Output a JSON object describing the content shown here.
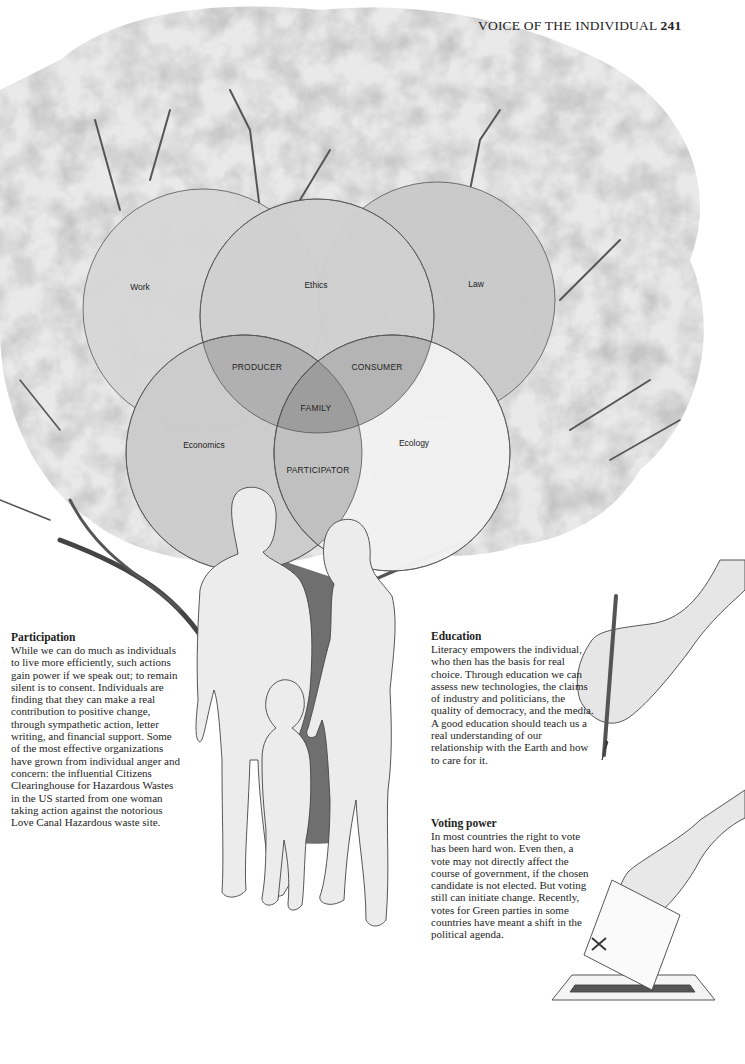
{
  "header": {
    "running_title": "VOICE OF THE INDIVIDUAL",
    "page_number": "241"
  },
  "diagram": {
    "type": "venn",
    "circles": [
      {
        "label": "Work",
        "cx": 203,
        "cy": 309,
        "r": 120,
        "fill": "#d4d4d4"
      },
      {
        "label": "Ethics",
        "cx": 317,
        "cy": 326,
        "r": 117,
        "fill": "#cfcfcf"
      },
      {
        "label": "Law",
        "cx": 437,
        "cy": 300,
        "r": 118,
        "fill": "#c9c9c9"
      },
      {
        "label": "Economics",
        "cx": 244,
        "cy": 453,
        "r": 118,
        "fill": "#cdcdcd"
      },
      {
        "label": "Ecology",
        "cx": 392,
        "cy": 453,
        "r": 118,
        "fill": "#efefef"
      }
    ],
    "intersections": [
      {
        "label": "PRODUCER",
        "x": 257,
        "y": 370
      },
      {
        "label": "CONSUMER",
        "x": 377,
        "y": 370
      },
      {
        "label": "FAMILY",
        "x": 316,
        "y": 411
      },
      {
        "label": "PARTICIPATOR",
        "x": 318,
        "y": 473
      }
    ],
    "circle_label_positions": [
      {
        "label": "Work",
        "x": 140,
        "y": 290
      },
      {
        "label": "Ethics",
        "x": 316,
        "y": 288
      },
      {
        "label": "Law",
        "x": 476,
        "y": 287
      },
      {
        "label": "Economics",
        "x": 204,
        "y": 448
      },
      {
        "label": "Ecology",
        "x": 414,
        "y": 446
      }
    ]
  },
  "sections": {
    "participation": {
      "heading": "Participation",
      "body": "While we can do much as individuals to live more efficiently, such actions gain power if we speak out; to remain silent is to consent. Individuals are finding that they can make a real contribution to positive change, through sympathetic action, letter writing, and financial support. Some of the most effective organizations have grown from individual anger and concern: the influential Citizens Clearinghouse for Hazardous Wastes in the US started from one woman taking action against the notorious Love Canal Hazardous waste site."
    },
    "education": {
      "heading": "Education",
      "body": "Literacy empowers the individual, who then has the basis for real choice. Through education we can assess new technologies, the claims of industry and politicians, the quality of democracy, and the media. A good education should teach us a real understanding of our relationship with the Earth and how to care for it."
    },
    "voting_power": {
      "heading": "Voting power",
      "body": "In most countries the right to vote has been hard won. Even then, a vote may not directly affect the course of government, if the chosen candidate is not elected. But voting still can initiate change. Recently, votes for Green parties in some countries have meant a shift in the political agenda."
    }
  },
  "illustrations": {
    "tree": "tree-illustration",
    "family": "family-figures",
    "pencil_hand": "hand-holding-pencil",
    "ballot_hand": "hand-casting-ballot"
  }
}
